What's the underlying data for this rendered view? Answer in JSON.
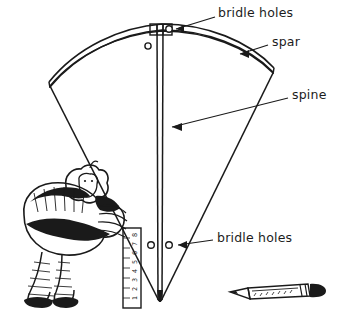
{
  "illustration": {
    "title": "Kite construction diagram",
    "subject": "fan-shaped sled kite with labelled spar, spine and bridle holes",
    "background_color": "#ffffff",
    "ink_color": "#1a1a1a"
  },
  "labels": [
    {
      "id": "bridle-holes-top",
      "text": "bridle holes",
      "points_to": "holes at the top of the spine where the spar crosses"
    },
    {
      "id": "spar",
      "text": "spar",
      "points_to": "curved cross member along the top edge of the kite"
    },
    {
      "id": "spine",
      "text": "spine",
      "points_to": "vertical centre member running from spar to kite tip"
    },
    {
      "id": "bridle-holes-bottom",
      "text": "bridle holes",
      "points_to": "pair of holes either side of the spine near the lower kite"
    }
  ],
  "kite": {
    "name": "fan kite",
    "parts": [
      "spar",
      "spine",
      "sail",
      "bridle holes"
    ],
    "bridle_hole_count_top": 2,
    "bridle_hole_count_bottom": 2
  },
  "figure": {
    "name": "bundled cartoon character"
  },
  "ruler": {
    "name": "ruler",
    "orientation": "vertical",
    "digits": [
      "8",
      "7",
      "6",
      "5",
      "4",
      "3",
      "2",
      "1"
    ]
  },
  "pencil": {
    "name": "pencil",
    "description": "sharpened pencil lying horizontally at lower right"
  }
}
